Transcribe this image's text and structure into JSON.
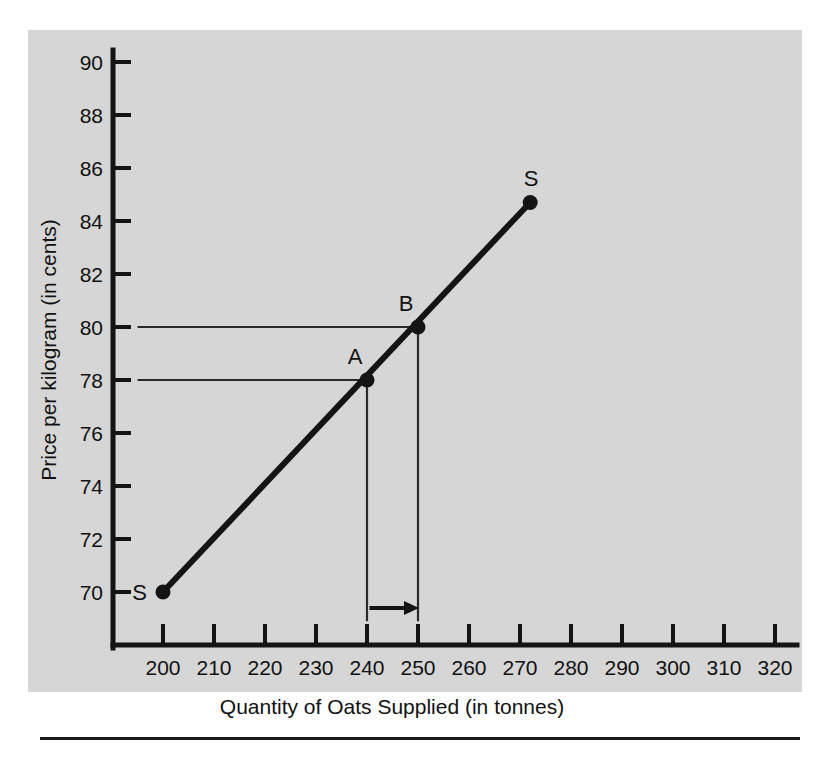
{
  "figure": {
    "background_color": "#d6d6d6",
    "ink_color": "#141414"
  },
  "chart_data": {
    "type": "line",
    "title": "",
    "subtitle": "",
    "xlabel": "Quantity of Oats Supplied (in tonnes)",
    "ylabel": "Price per kilogram (in cents)",
    "xlim": [
      195,
      325
    ],
    "ylim": [
      68.5,
      90
    ],
    "xticks": [
      200,
      210,
      220,
      230,
      240,
      250,
      260,
      270,
      280,
      290,
      300,
      310,
      320
    ],
    "xtick_labels": [
      "200",
      "210",
      "220",
      "230",
      "240",
      "250",
      "260",
      "270",
      "280",
      "290",
      "300",
      "310",
      "320"
    ],
    "yticks": [
      70,
      72,
      74,
      76,
      78,
      80,
      82,
      84,
      86,
      88,
      90
    ],
    "ytick_labels": [
      "70",
      "72",
      "74",
      "76",
      "78",
      "80",
      "82",
      "84",
      "86",
      "88",
      "90"
    ],
    "grid": false,
    "legend_position": "none",
    "series": [
      {
        "name": "S",
        "label": "Supply curve",
        "x": [
          200,
          272
        ],
        "y": [
          70,
          84.7
        ],
        "style": "solid",
        "color": "#141414"
      }
    ],
    "annotations": [
      {
        "label": "S",
        "x": 200,
        "y": 70,
        "role": "curve-endpoint-lower",
        "label_side": "left"
      },
      {
        "label": "S",
        "x": 272,
        "y": 84.7,
        "role": "curve-endpoint-upper",
        "label_side": "above"
      },
      {
        "label": "A",
        "x": 240,
        "y": 78,
        "role": "marked-point",
        "label_side": "above-left"
      },
      {
        "label": "B",
        "x": 250,
        "y": 80,
        "role": "marked-point",
        "label_side": "above-left"
      }
    ],
    "guide_lines": [
      {
        "from": [
          195,
          78
        ],
        "to": [
          240,
          78
        ],
        "orientation": "horizontal",
        "for_point": "A"
      },
      {
        "from": [
          240,
          78
        ],
        "to": [
          240,
          68.9
        ],
        "orientation": "vertical",
        "for_point": "A"
      },
      {
        "from": [
          195,
          80
        ],
        "to": [
          250,
          80
        ],
        "orientation": "horizontal",
        "for_point": "B"
      },
      {
        "from": [
          250,
          80
        ],
        "to": [
          250,
          68.9
        ],
        "orientation": "vertical",
        "for_point": "B"
      }
    ],
    "arrows": [
      {
        "from": [
          240.5,
          69.4
        ],
        "to": [
          250,
          69.4
        ],
        "direction": "right",
        "meaning": "quantity increase from 240 to 250"
      }
    ]
  }
}
